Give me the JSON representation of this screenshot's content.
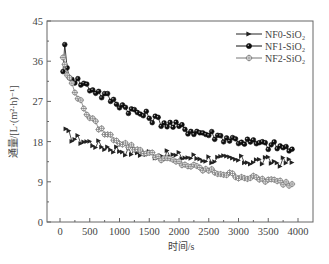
{
  "chart_data": {
    "type": "line",
    "title": "",
    "xlabel": "时间/s",
    "ylabel": "通量/[L·(m²·h)⁻¹]",
    "xlim": [
      -200,
      4250
    ],
    "ylim": [
      0,
      45
    ],
    "xticks": [
      0,
      500,
      1000,
      1500,
      2000,
      2500,
      3000,
      3500,
      4000
    ],
    "yticks": [
      0,
      9,
      18,
      27,
      36,
      45
    ],
    "grid": false,
    "legend_position": "upper right",
    "series": [
      {
        "name": "NF0-SiO₂",
        "marker": "triangle-right",
        "color": "#222222",
        "x": [
          100,
          200,
          300,
          400,
          500,
          600,
          700,
          800,
          900,
          1000,
          1200,
          1400,
          1600,
          1800,
          2000,
          2200,
          2400,
          2600,
          2800,
          3000,
          3200,
          3400,
          3600,
          3800,
          3900
        ],
        "values": [
          20.0,
          19.0,
          18.5,
          18.2,
          17.8,
          17.5,
          17.0,
          16.8,
          16.5,
          16.2,
          15.8,
          15.5,
          15.2,
          14.9,
          14.7,
          14.5,
          14.3,
          14.1,
          13.9,
          13.8,
          13.7,
          13.6,
          13.5,
          13.4,
          13.3
        ]
      },
      {
        "name": "NF1-SiO₂",
        "marker": "filled-circle",
        "color": "#111111",
        "x": [
          50,
          80,
          120,
          200,
          300,
          400,
          500,
          600,
          700,
          800,
          900,
          1000,
          1200,
          1400,
          1600,
          1800,
          2000,
          2200,
          2400,
          2600,
          2800,
          3000,
          3200,
          3400,
          3600,
          3800,
          3900
        ],
        "values": [
          34.5,
          39.0,
          34.0,
          32.5,
          31.5,
          31.0,
          30.0,
          29.5,
          28.5,
          28.0,
          27.0,
          26.5,
          25.0,
          24.0,
          23.0,
          22.0,
          21.2,
          20.5,
          20.0,
          19.4,
          18.8,
          18.3,
          17.8,
          17.3,
          17.0,
          16.6,
          16.3
        ]
      },
      {
        "name": "NF2-SiO₂",
        "marker": "crossed-circle",
        "color": "#777777",
        "x": [
          50,
          80,
          120,
          200,
          300,
          400,
          500,
          600,
          700,
          800,
          900,
          1000,
          1200,
          1400,
          1600,
          1800,
          2000,
          2200,
          2400,
          2600,
          2800,
          3000,
          3200,
          3400,
          3600,
          3800,
          3900
        ],
        "values": [
          37.0,
          35.0,
          33.0,
          31.0,
          28.0,
          25.5,
          23.5,
          22.0,
          20.5,
          19.5,
          18.8,
          18.0,
          16.8,
          15.8,
          14.8,
          14.0,
          13.2,
          12.5,
          11.8,
          11.2,
          10.7,
          10.3,
          9.9,
          9.5,
          9.1,
          8.7,
          8.5
        ]
      }
    ]
  }
}
